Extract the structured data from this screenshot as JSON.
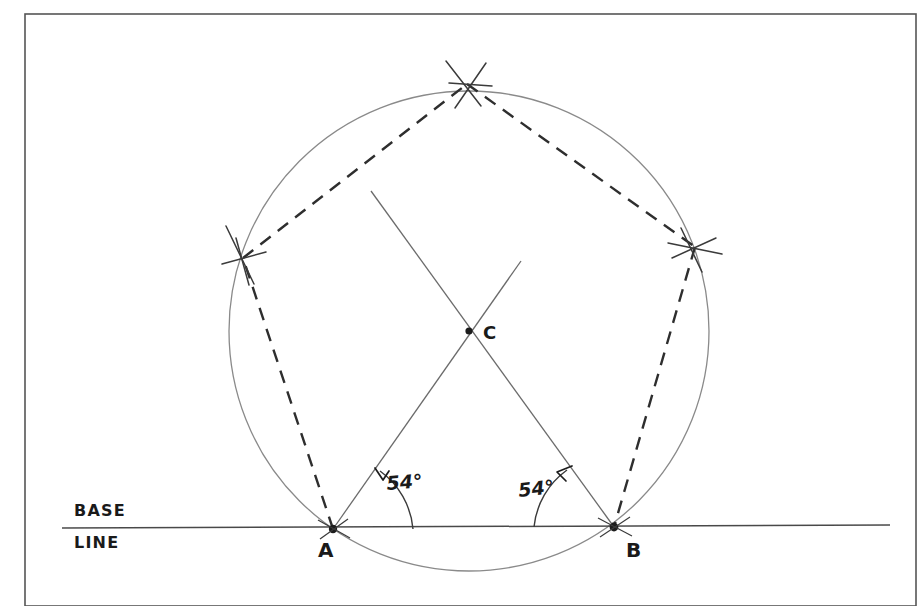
{
  "figure": {
    "title_visible": false,
    "background_color": "#ffffff",
    "ink_color": "#3a3a3a",
    "label_color": "#1a1a1a",
    "frame": {
      "name": "page-border",
      "x": 25,
      "y": 14,
      "width": 891,
      "height": 592,
      "color": "#4a4a4a"
    },
    "labels": {
      "base_line_top": "BASE",
      "base_line_bottom": "LINE",
      "point_a": "A",
      "point_b": "B",
      "point_c": "C",
      "angle_a": "54°",
      "angle_b": "54°"
    },
    "points": {
      "A": {
        "x": 333,
        "y": 529
      },
      "B": {
        "x": 614,
        "y": 527
      },
      "C": {
        "x": 469,
        "y": 331
      },
      "top_vertex": {
        "x": 467,
        "y": 84
      },
      "left_vertex": {
        "x": 243,
        "y": 258
      },
      "right_vertex": {
        "x": 695,
        "y": 247
      }
    },
    "circle": {
      "cx": 469,
      "cy": 331,
      "r": 240
    },
    "base_line": {
      "x1": 62,
      "y1": 528,
      "x2": 890,
      "y2": 525
    },
    "construction_lines": [
      {
        "name": "ray-from-a-through-c",
        "x1": 333,
        "y1": 529,
        "x2": 520,
        "y2": 262
      },
      {
        "name": "ray-from-b-through-c",
        "x1": 614,
        "y1": 527,
        "x2": 372,
        "y2": 192
      }
    ],
    "dashed_chords": [
      {
        "name": "chord-a-to-left-vertex",
        "x1": 333,
        "y1": 529,
        "x2": 243,
        "y2": 258
      },
      {
        "name": "chord-left-vertex-to-top",
        "x1": 243,
        "y1": 258,
        "x2": 467,
        "y2": 84
      },
      {
        "name": "chord-top-to-right-vertex",
        "x1": 467,
        "y1": 84,
        "x2": 695,
        "y2": 247
      },
      {
        "name": "chord-right-vertex-to-b",
        "x1": 695,
        "y1": 247,
        "x2": 614,
        "y2": 527
      }
    ],
    "angle_arcs": [
      {
        "name": "angle-arc-at-a",
        "value": "54°"
      },
      {
        "name": "angle-arc-at-b",
        "value": "54°"
      }
    ]
  }
}
